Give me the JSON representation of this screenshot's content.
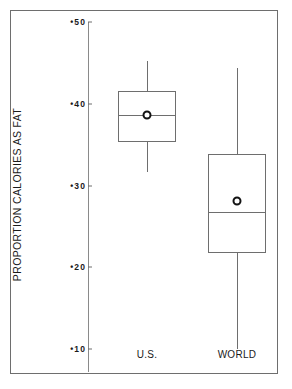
{
  "chart_data": {
    "type": "box",
    "title": "",
    "xlabel": "",
    "ylabel": "PROPORTION CALORIES AS FAT",
    "ylim": [
      0.1,
      0.5
    ],
    "grid": false,
    "legend": "none",
    "y_ticks": [
      {
        "value": 0.5,
        "label": "•50"
      },
      {
        "value": 0.4,
        "label": "•40"
      },
      {
        "value": 0.3,
        "label": "•30"
      },
      {
        "value": 0.2,
        "label": "•20"
      },
      {
        "value": 0.1,
        "label": "•10"
      }
    ],
    "categories": [
      "U.S.",
      "WORLD"
    ],
    "boxes": [
      {
        "name": "U.S.",
        "whisker_low": 0.316,
        "q1": 0.353,
        "median": 0.386,
        "q3": 0.415,
        "whisker_high": 0.452,
        "mean": 0.386
      },
      {
        "name": "WORLD",
        "whisker_low": 0.1,
        "q1": 0.217,
        "median": 0.268,
        "q3": 0.339,
        "whisker_high": 0.444,
        "mean": 0.281
      }
    ]
  },
  "axis": {
    "y_title": "PROPORTION CALORIES AS FAT"
  },
  "x_labels": [
    {
      "text": "U.S."
    },
    {
      "text": "WORLD"
    }
  ],
  "colors": {
    "line": "#6e6e6e",
    "marker": "#131313",
    "text": "#1a1a1a",
    "background": "#ffffff",
    "frame": "#6e6e6e"
  }
}
